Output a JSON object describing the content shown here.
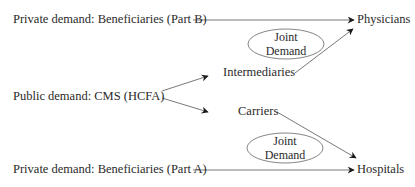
{
  "diagram": {
    "sources": {
      "private_b": "Private demand: Beneficiaries (Part B)",
      "public": "Public demand: CMS (HCFA)",
      "private_a": "Private demand: Beneficiaries (Part A)"
    },
    "intermediaries": {
      "intermediaries": "Intermediaries",
      "carriers": "Carriers"
    },
    "providers": {
      "physicians": "Physicians",
      "hospitals": "Hospitals"
    },
    "joint_demand_top": {
      "line1": "Joint",
      "line2": "Demand"
    },
    "joint_demand_bottom": {
      "line1": "Joint",
      "line2": "Demand"
    },
    "edges": [
      {
        "from": "Private demand: Beneficiaries (Part B)",
        "to": "Physicians"
      },
      {
        "from": "Public demand: CMS (HCFA)",
        "to": "Intermediaries"
      },
      {
        "from": "Public demand: CMS (HCFA)",
        "to": "Carriers"
      },
      {
        "from": "Intermediaries",
        "to": "Physicians"
      },
      {
        "from": "Carriers",
        "to": "Hospitals"
      },
      {
        "from": "Private demand: Beneficiaries (Part A)",
        "to": "Hospitals"
      }
    ]
  }
}
